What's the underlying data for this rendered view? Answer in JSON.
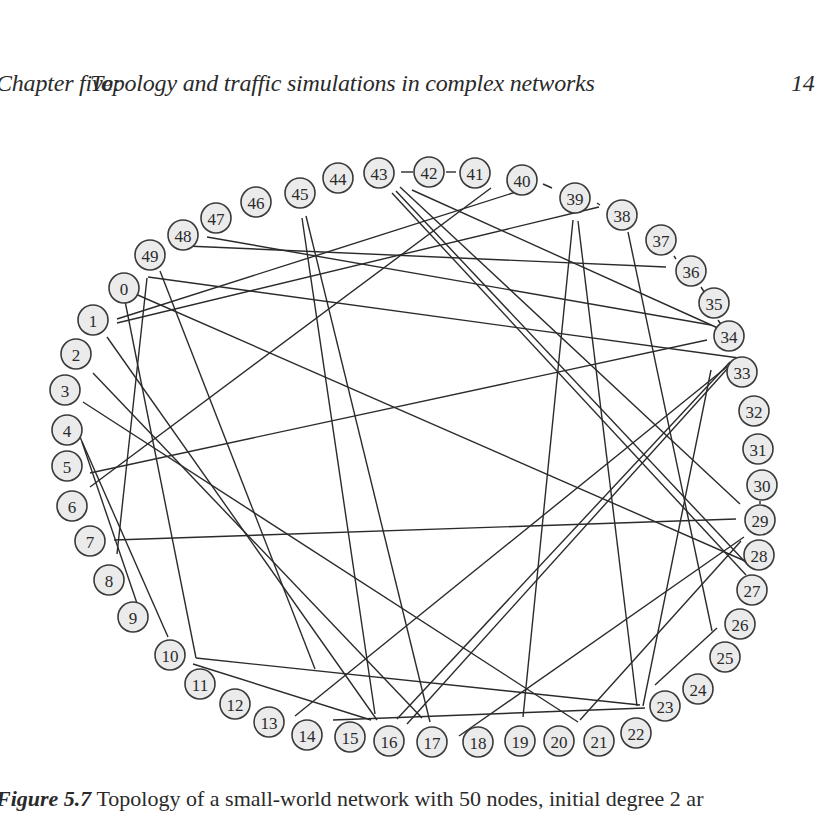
{
  "header": {
    "chapter": "Chapter five:",
    "title": "Topology and traffic simulations in complex networks",
    "page_number": "14"
  },
  "figure": {
    "label": "Figure 5.7",
    "caption_text": "Topology of a small-world network with 50 nodes, initial degree 2 ar",
    "node_fill": "#ebebeb",
    "node_stroke": "#3a3a3a",
    "edge_color": "#2b2b2b",
    "nodes": [
      {
        "id": "0",
        "x": 124,
        "y": 288
      },
      {
        "id": "1",
        "x": 93,
        "y": 320
      },
      {
        "id": "2",
        "x": 76,
        "y": 354
      },
      {
        "id": "3",
        "x": 65,
        "y": 390
      },
      {
        "id": "4",
        "x": 67,
        "y": 430
      },
      {
        "id": "5",
        "x": 67,
        "y": 466
      },
      {
        "id": "6",
        "x": 72,
        "y": 506
      },
      {
        "id": "7",
        "x": 90,
        "y": 541
      },
      {
        "id": "8",
        "x": 109,
        "y": 580
      },
      {
        "id": "9",
        "x": 133,
        "y": 617
      },
      {
        "id": "10",
        "x": 170,
        "y": 655
      },
      {
        "id": "11",
        "x": 200,
        "y": 684
      },
      {
        "id": "12",
        "x": 235,
        "y": 704
      },
      {
        "id": "13",
        "x": 269,
        "y": 722
      },
      {
        "id": "14",
        "x": 307,
        "y": 735
      },
      {
        "id": "15",
        "x": 350,
        "y": 737
      },
      {
        "id": "16",
        "x": 389,
        "y": 741
      },
      {
        "id": "17",
        "x": 432,
        "y": 742
      },
      {
        "id": "18",
        "x": 478,
        "y": 742
      },
      {
        "id": "19",
        "x": 520,
        "y": 741
      },
      {
        "id": "20",
        "x": 559,
        "y": 741
      },
      {
        "id": "21",
        "x": 599,
        "y": 741
      },
      {
        "id": "22",
        "x": 636,
        "y": 733
      },
      {
        "id": "23",
        "x": 665,
        "y": 706
      },
      {
        "id": "24",
        "x": 698,
        "y": 689
      },
      {
        "id": "25",
        "x": 725,
        "y": 657
      },
      {
        "id": "26",
        "x": 740,
        "y": 624
      },
      {
        "id": "27",
        "x": 752,
        "y": 590
      },
      {
        "id": "28",
        "x": 759,
        "y": 555
      },
      {
        "id": "29",
        "x": 760,
        "y": 520
      },
      {
        "id": "30",
        "x": 762,
        "y": 485
      },
      {
        "id": "31",
        "x": 758,
        "y": 449
      },
      {
        "id": "32",
        "x": 754,
        "y": 411
      },
      {
        "id": "33",
        "x": 742,
        "y": 372
      },
      {
        "id": "34",
        "x": 729,
        "y": 336
      },
      {
        "id": "35",
        "x": 714,
        "y": 303
      },
      {
        "id": "36",
        "x": 691,
        "y": 271
      },
      {
        "id": "37",
        "x": 661,
        "y": 240
      },
      {
        "id": "38",
        "x": 622,
        "y": 215
      },
      {
        "id": "39",
        "x": 575,
        "y": 198
      },
      {
        "id": "40",
        "x": 522,
        "y": 180
      },
      {
        "id": "41",
        "x": 475,
        "y": 173
      },
      {
        "id": "42",
        "x": 429,
        "y": 172
      },
      {
        "id": "43",
        "x": 379,
        "y": 173
      },
      {
        "id": "44",
        "x": 338,
        "y": 178
      },
      {
        "id": "45",
        "x": 300,
        "y": 193
      },
      {
        "id": "46",
        "x": 256,
        "y": 202
      },
      {
        "id": "47",
        "x": 216,
        "y": 218
      },
      {
        "id": "48",
        "x": 183,
        "y": 235
      },
      {
        "id": "49",
        "x": 150,
        "y": 255
      }
    ],
    "edges": [
      {
        "x1": 401,
        "y1": 172,
        "x2": 413,
        "y2": 172
      },
      {
        "x1": 446,
        "y1": 172,
        "x2": 456,
        "y2": 172
      },
      {
        "x1": 543,
        "y1": 184,
        "x2": 552,
        "y2": 188
      },
      {
        "x1": 597,
        "y1": 203,
        "x2": 600,
        "y2": 205
      },
      {
        "x1": 674,
        "y1": 256,
        "x2": 676,
        "y2": 259
      },
      {
        "x1": 701,
        "y1": 287,
        "x2": 708,
        "y2": 298
      },
      {
        "x1": 718,
        "y1": 320,
        "x2": 722,
        "y2": 326
      },
      {
        "x1": 760,
        "y1": 501,
        "x2": 760,
        "y2": 504
      },
      {
        "x1": 117,
        "y1": 323,
        "x2": 599,
        "y2": 207
      },
      {
        "x1": 117,
        "y1": 319,
        "x2": 519,
        "y2": 191
      },
      {
        "x1": 90,
        "y1": 487,
        "x2": 491,
        "y2": 188
      },
      {
        "x1": 186,
        "y1": 246,
        "x2": 666,
        "y2": 267
      },
      {
        "x1": 207,
        "y1": 237,
        "x2": 711,
        "y2": 325
      },
      {
        "x1": 148,
        "y1": 277,
        "x2": 739,
        "y2": 358
      },
      {
        "x1": 107,
        "y1": 337,
        "x2": 377,
        "y2": 720
      },
      {
        "x1": 93,
        "y1": 373,
        "x2": 422,
        "y2": 718
      },
      {
        "x1": 83,
        "y1": 402,
        "x2": 578,
        "y2": 722
      },
      {
        "x1": 82,
        "y1": 442,
        "x2": 142,
        "y2": 618
      },
      {
        "x1": 80,
        "y1": 437,
        "x2": 168,
        "y2": 637
      },
      {
        "x1": 90,
        "y1": 473,
        "x2": 707,
        "y2": 340
      },
      {
        "x1": 114,
        "y1": 540,
        "x2": 736,
        "y2": 519
      },
      {
        "x1": 117,
        "y1": 554,
        "x2": 147,
        "y2": 278
      },
      {
        "x1": 160,
        "y1": 271,
        "x2": 315,
        "y2": 669
      },
      {
        "x1": 124,
        "y1": 289,
        "x2": 745,
        "y2": 561
      },
      {
        "x1": 125,
        "y1": 301,
        "x2": 196,
        "y2": 658
      },
      {
        "x1": 196,
        "y1": 658,
        "x2": 640,
        "y2": 705
      },
      {
        "x1": 193,
        "y1": 664,
        "x2": 371,
        "y2": 720
      },
      {
        "x1": 295,
        "y1": 716,
        "x2": 728,
        "y2": 366
      },
      {
        "x1": 333,
        "y1": 720,
        "x2": 645,
        "y2": 708
      },
      {
        "x1": 302,
        "y1": 218,
        "x2": 375,
        "y2": 714
      },
      {
        "x1": 306,
        "y1": 216,
        "x2": 430,
        "y2": 722
      },
      {
        "x1": 400,
        "y1": 187,
        "x2": 740,
        "y2": 504
      },
      {
        "x1": 396,
        "y1": 191,
        "x2": 748,
        "y2": 565
      },
      {
        "x1": 392,
        "y1": 193,
        "x2": 746,
        "y2": 575
      },
      {
        "x1": 412,
        "y1": 190,
        "x2": 720,
        "y2": 329
      },
      {
        "x1": 407,
        "y1": 724,
        "x2": 728,
        "y2": 368
      },
      {
        "x1": 397,
        "y1": 719,
        "x2": 730,
        "y2": 362
      },
      {
        "x1": 459,
        "y1": 736,
        "x2": 744,
        "y2": 537
      },
      {
        "x1": 523,
        "y1": 717,
        "x2": 573,
        "y2": 220
      },
      {
        "x1": 578,
        "y1": 221,
        "x2": 637,
        "y2": 706
      },
      {
        "x1": 628,
        "y1": 232,
        "x2": 712,
        "y2": 631
      },
      {
        "x1": 643,
        "y1": 706,
        "x2": 711,
        "y2": 370
      },
      {
        "x1": 655,
        "y1": 685,
        "x2": 717,
        "y2": 628
      },
      {
        "x1": 580,
        "y1": 720,
        "x2": 741,
        "y2": 541
      }
    ]
  }
}
